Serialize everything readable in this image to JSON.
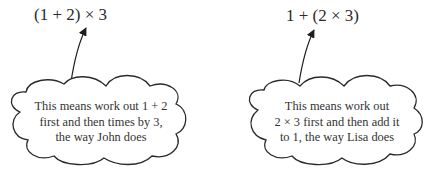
{
  "diagram": {
    "type": "annotated-expressions",
    "colors": {
      "background": "#ffffff",
      "ink": "#2a2a2a"
    },
    "items": [
      {
        "id": "john",
        "expression": "(1 + 2) × 3",
        "callout_shape": "cloud",
        "arrow": "from-cloud-to-expression",
        "lines": [
          "This means work out 1 + 2",
          "first and then times by 3,",
          "the way John does"
        ]
      },
      {
        "id": "lisa",
        "expression": "1 + (2 × 3)",
        "callout_shape": "cloud",
        "arrow": "from-cloud-to-expression",
        "lines": [
          "This means work out",
          "2 × 3 first and then add it",
          "to 1, the way Lisa does"
        ]
      }
    ]
  }
}
